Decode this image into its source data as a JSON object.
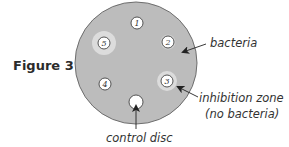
{
  "figure": {
    "label": "Figure 3",
    "plate": {
      "cx": 136,
      "cy": 63,
      "r": 61,
      "fill": "#bcbcbc",
      "stroke": "#6e6e6e"
    },
    "discs": [
      {
        "id": "1",
        "label": "1",
        "cx": 137,
        "cy": 23,
        "r": 6,
        "zone_r": 0
      },
      {
        "id": "2",
        "label": "2",
        "cx": 168,
        "cy": 42,
        "r": 6,
        "zone_r": 8
      },
      {
        "id": "3",
        "label": "3",
        "cx": 167,
        "cy": 81,
        "r": 6,
        "zone_r": 10
      },
      {
        "id": "4",
        "label": "4",
        "cx": 105,
        "cy": 84,
        "r": 6,
        "zone_r": 0
      },
      {
        "id": "5",
        "label": "5",
        "cx": 104,
        "cy": 43,
        "r": 6,
        "zone_r": 12
      }
    ],
    "control_disc": {
      "cx": 136,
      "cy": 102,
      "r": 7,
      "label": ""
    },
    "colors": {
      "zone": "#dedede",
      "disc": "#ffffff",
      "disc_stroke": "#444444",
      "text": "#333333"
    },
    "annotations": {
      "bacteria": "bacteria",
      "inhibition_zone_line1": "inhibition zone",
      "inhibition_zone_line2": "(no bacteria)",
      "control_disc": "control disc"
    }
  }
}
